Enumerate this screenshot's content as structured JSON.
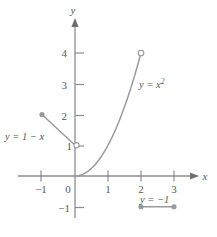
{
  "figure": {
    "title": "",
    "axes": {
      "x_axis_label": "x",
      "y_axis_label": "y",
      "x_ticks": [
        {
          "value": -1,
          "label": "−1"
        },
        {
          "value": 0,
          "label": "0"
        },
        {
          "value": 1,
          "label": "1"
        },
        {
          "value": 2,
          "label": "2"
        },
        {
          "value": 3,
          "label": "3"
        }
      ],
      "y_ticks": [
        {
          "value": -1,
          "label": "−1"
        },
        {
          "value": 1,
          "label": "1"
        },
        {
          "value": 2,
          "label": "2"
        },
        {
          "value": 3,
          "label": "3"
        },
        {
          "value": 4,
          "label": "4"
        }
      ]
    },
    "labels": {
      "linear_piece": "y = 1 − x",
      "quadratic_piece_base": "y = x",
      "quadratic_piece_exponent": "2",
      "constant_piece": "y = −1"
    },
    "colors": {
      "axis": "#8d8d90",
      "curve": "#9a9a9d",
      "text": "#58585a",
      "marker_fill": "#9a9a9d",
      "background": "#ffffff"
    }
  },
  "chart_data": {
    "type": "line",
    "title": "",
    "xlabel": "x",
    "ylabel": "y",
    "xlim": [
      -1.6,
      3.9
    ],
    "ylim": [
      -1.6,
      4.9
    ],
    "grid": false,
    "legend": "none",
    "xticks": [
      -1,
      0,
      1,
      2,
      3
    ],
    "yticks": [
      -1,
      1,
      2,
      3,
      4
    ],
    "series": [
      {
        "name": "y = 1 − x",
        "expression": "1 - x",
        "domain": [
          -1,
          0
        ],
        "x": [
          -1,
          -0.5,
          0
        ],
        "values": [
          2,
          1.5,
          1
        ],
        "endpoint_left": {
          "x": -1,
          "y": 2,
          "style": "closed"
        },
        "endpoint_right": {
          "x": 0,
          "y": 1,
          "style": "open"
        }
      },
      {
        "name": "y = x²",
        "expression": "x^2",
        "domain": [
          0,
          2
        ],
        "x": [
          0,
          0.25,
          0.5,
          0.75,
          1,
          1.25,
          1.5,
          1.75,
          2
        ],
        "values": [
          0,
          0.0625,
          0.25,
          0.5625,
          1,
          1.5625,
          2.25,
          3.0625,
          4
        ],
        "endpoint_left": {
          "x": 0,
          "y": 0,
          "style": "closed"
        },
        "endpoint_right": {
          "x": 2,
          "y": 4,
          "style": "open"
        }
      },
      {
        "name": "y = −1",
        "expression": "-1",
        "domain": [
          2,
          3
        ],
        "x": [
          2,
          3
        ],
        "values": [
          -1,
          -1
        ],
        "endpoint_left": {
          "x": 2,
          "y": -1,
          "style": "closed"
        },
        "endpoint_right": {
          "x": 3,
          "y": -1,
          "style": "closed"
        }
      }
    ],
    "annotations": [
      {
        "text": "y = 1 − x",
        "x": -1.45,
        "y": 1.0
      },
      {
        "text": "y = x²",
        "x": 2.05,
        "y": 3.15
      },
      {
        "text": "y = −1",
        "x": 2.05,
        "y": -0.6
      }
    ]
  }
}
